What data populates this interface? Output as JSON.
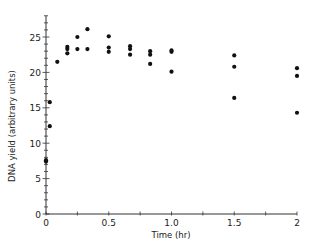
{
  "chart_data": {
    "type": "scatter",
    "title": "",
    "xlabel": "Time (hr)",
    "ylabel": "DNA yield (arbitrary units)",
    "xlim": [
      0,
      2
    ],
    "ylim": [
      0,
      28
    ],
    "grid": false,
    "legend": null,
    "x_ticks": [
      0,
      0.5,
      1.0,
      1.5,
      2
    ],
    "x_tick_labels": [
      "0",
      "0.5",
      "1.0",
      "1.5",
      "2"
    ],
    "y_ticks": [
      0,
      5,
      10,
      15,
      20,
      25
    ],
    "y_tick_labels": [
      "0",
      "5",
      "10",
      "15",
      "20",
      "25"
    ],
    "series": [
      {
        "name": "DNA yield",
        "points": [
          {
            "x": 0.0,
            "y": 7.4
          },
          {
            "x": 0.0,
            "y": 7.6
          },
          {
            "x": 0.03,
            "y": 12.4
          },
          {
            "x": 0.03,
            "y": 15.8
          },
          {
            "x": 0.09,
            "y": 21.5
          },
          {
            "x": 0.17,
            "y": 22.7
          },
          {
            "x": 0.17,
            "y": 23.3
          },
          {
            "x": 0.17,
            "y": 23.6
          },
          {
            "x": 0.25,
            "y": 23.3
          },
          {
            "x": 0.25,
            "y": 25.0
          },
          {
            "x": 0.33,
            "y": 23.3
          },
          {
            "x": 0.33,
            "y": 26.1
          },
          {
            "x": 0.5,
            "y": 22.9
          },
          {
            "x": 0.5,
            "y": 23.5
          },
          {
            "x": 0.5,
            "y": 25.1
          },
          {
            "x": 0.67,
            "y": 22.5
          },
          {
            "x": 0.67,
            "y": 23.3
          },
          {
            "x": 0.67,
            "y": 23.7
          },
          {
            "x": 0.83,
            "y": 21.2
          },
          {
            "x": 0.83,
            "y": 22.5
          },
          {
            "x": 0.83,
            "y": 23.0
          },
          {
            "x": 1.0,
            "y": 20.1
          },
          {
            "x": 1.0,
            "y": 22.9
          },
          {
            "x": 1.0,
            "y": 23.1
          },
          {
            "x": 1.5,
            "y": 16.4
          },
          {
            "x": 1.5,
            "y": 20.8
          },
          {
            "x": 1.5,
            "y": 22.4
          },
          {
            "x": 2.0,
            "y": 14.3
          },
          {
            "x": 2.0,
            "y": 19.5
          },
          {
            "x": 2.0,
            "y": 20.6
          }
        ]
      }
    ]
  },
  "style": {
    "marker_color": "#111111",
    "axis_color": "#333333"
  }
}
